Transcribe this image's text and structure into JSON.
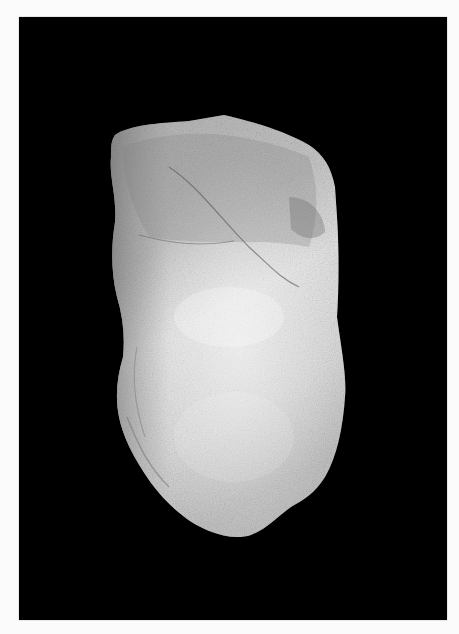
{
  "photo": {
    "subject": "rock specimen",
    "background_color": "#000000",
    "page_color": "#fbfbfb",
    "specimen_colors": {
      "light": "#e8e8e8",
      "mid": "#b8b8b8",
      "dark": "#7a7a7a"
    }
  }
}
